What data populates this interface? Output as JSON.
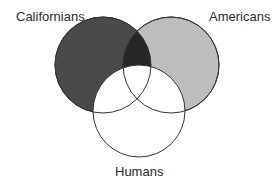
{
  "diagram": {
    "type": "venn",
    "sets": [
      {
        "id": "californians",
        "label": "Californians",
        "fill": "#4a4a4a",
        "shading": "dark"
      },
      {
        "id": "americans",
        "label": "Americans",
        "fill": "#bdbdbd",
        "shading": "light"
      },
      {
        "id": "humans",
        "label": "Humans",
        "fill": "#ffffff",
        "shading": "none"
      }
    ],
    "regions": [
      {
        "sets": [
          "californians",
          "americans"
        ],
        "excluding": [
          "humans"
        ],
        "fill": "#262626",
        "shading": "darkest"
      },
      {
        "sets": [
          "humans"
        ],
        "fill": "#ffffff",
        "shading": "unshaded"
      }
    ],
    "stroke_color": "#333333"
  }
}
